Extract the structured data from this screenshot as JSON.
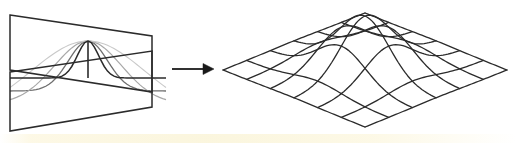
{
  "figure": {
    "background_color": "#ffffff",
    "width": 517,
    "height": 143,
    "panels": [
      {
        "id": "left-panel",
        "name": "crossing-planes-gaussian-profiles",
        "description": "Two crossing quadrilateral planes (bowtie arrangement) carrying nested 1D Gaussian profile curves of decreasing darkness",
        "stroke_color": "#2b2b2b",
        "bounds": {
          "x": 8,
          "y": 12,
          "width": 160,
          "height": 120
        },
        "apex": {
          "x": 88,
          "y": 41
        },
        "base_center": {
          "x": 88,
          "y": 78
        }
      },
      {
        "id": "arrow",
        "name": "transform-arrow",
        "description": "Solid right-pointing arrow linking the two panels",
        "stroke_color": "#1a1a1a",
        "x1": 172,
        "y1": 69,
        "x2": 212,
        "y2": 69,
        "head_length": 11,
        "head_half_width": 5
      },
      {
        "id": "right-panel",
        "name": "gaussian-surface-mesh",
        "description": "Isometric wireframe mesh of a 2D Gaussian bell surface over a diamond-shaped grid",
        "stroke_color": "#2b2b2b",
        "bounds": {
          "x": 222,
          "y": 12,
          "width": 284,
          "height": 118
        },
        "peak": {
          "x": 365,
          "y": 18
        },
        "diamond_corners": {
          "left": {
            "x": 222,
            "y": 70
          },
          "top": {
            "x": 365,
            "y": 13
          },
          "right": {
            "x": 505,
            "y": 70
          },
          "bottom": {
            "x": 365,
            "y": 126
          }
        },
        "grid_divisions": 6
      }
    ]
  },
  "chart_data": {
    "type": "line",
    "xlabel": "",
    "ylabel": "",
    "left_figure": {
      "type": "line",
      "description": "Nested 1D Gaussian profile curves drawn on two crossing planes",
      "curves": [
        {
          "name": "narrow-gaussian-dark",
          "sigma": 0.3,
          "amplitude": 1.0,
          "stroke": "#2b2b2b",
          "stroke_width": 1.5
        },
        {
          "name": "mid-gaussian-medium",
          "sigma": 0.55,
          "amplitude": 1.0,
          "stroke": "#6e6e6e",
          "stroke_width": 1.3
        },
        {
          "name": "wide-gaussian-light",
          "sigma": 0.95,
          "amplitude": 1.0,
          "stroke": "#a8a8a8",
          "stroke_width": 1.2
        },
        {
          "name": "widest-gaussian-faint",
          "sigma": 1.6,
          "amplitude": 1.0,
          "stroke": "#c9c9c9",
          "stroke_width": 1.1
        }
      ],
      "planes": [
        {
          "name": "upper-plane",
          "corners": [
            [
              10,
              15
            ],
            [
              152,
              36
            ],
            [
              152,
              92
            ],
            [
              10,
              70
            ]
          ]
        },
        {
          "name": "lower-plane",
          "corners": [
            [
              10,
              72
            ],
            [
              152,
              51
            ],
            [
              152,
              107
            ],
            [
              10,
              131
            ]
          ]
        }
      ],
      "axis_line": {
        "name": "center-vertical-axis",
        "x": 88,
        "y_top": 41,
        "y_bottom": 78
      }
    },
    "right_figure": {
      "type": "surface",
      "description": "2D Gaussian bell z = exp(-(x^2+y^2)/(2*sigma^2)) rendered as an isometric wireframe",
      "sigma": 0.34,
      "amplitude": 1.0,
      "xlim": [
        -1,
        1
      ],
      "ylim": [
        -1,
        1
      ],
      "zlim": [
        0,
        1
      ],
      "grid": {
        "u_divisions": 6,
        "v_divisions": 6,
        "visible": true
      },
      "projection": {
        "center_x": 365,
        "center_y": 70,
        "half_width": 142,
        "half_depth": 57,
        "height_scale": 54
      }
    }
  }
}
